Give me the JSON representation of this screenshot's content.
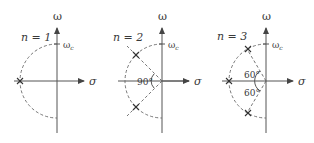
{
  "figure": {
    "axes": {
      "vertical_label": "ω",
      "horizontal_label": "σ",
      "radius_label": "ω",
      "radius_subscript": "c"
    },
    "panels": [
      {
        "order_label": "n = 1",
        "n": 1,
        "pole_angles_deg": [
          180
        ],
        "angle_annotations": []
      },
      {
        "order_label": "n = 2",
        "n": 2,
        "pole_angles_deg": [
          135,
          225
        ],
        "angle_annotations": [
          "90°"
        ]
      },
      {
        "order_label": "n = 3",
        "n": 3,
        "pole_angles_deg": [
          120,
          180,
          240
        ],
        "angle_annotations": [
          "60°",
          "60°"
        ]
      }
    ],
    "colors": {
      "ink": "#3a3a3a",
      "background": "#ffffff"
    }
  }
}
